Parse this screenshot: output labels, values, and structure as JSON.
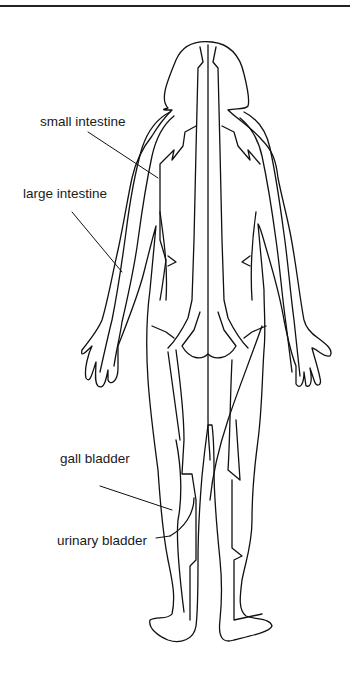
{
  "diagram": {
    "labels": [
      {
        "id": "small_intestine",
        "text": "small intestine"
      },
      {
        "id": "large_intestine",
        "text": "large intestine"
      },
      {
        "id": "gall_bladder",
        "text": "gall bladder"
      },
      {
        "id": "urinary_bladder",
        "text": "urinary bladder"
      }
    ],
    "colors": {
      "line": "#111111",
      "background": "#ffffff"
    }
  }
}
